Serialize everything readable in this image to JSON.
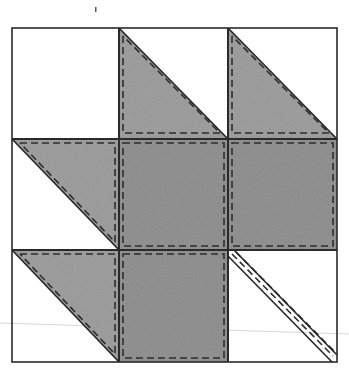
{
  "diagram": {
    "type": "quilt-block",
    "grid": {
      "rows": 3,
      "cols": 3,
      "x_lines": [
        12,
        119,
        228,
        337
      ],
      "y_lines": [
        28,
        139,
        250,
        362
      ]
    },
    "colors": {
      "background": "#ffffff",
      "fabric": "#9c9c9c",
      "fabric_dark": "#8e8e8e",
      "outline": "#2a2a2a",
      "seam": "#333333",
      "scan_line": "#d8d8d8"
    },
    "cells": [
      {
        "row": 0,
        "col": 0,
        "kind": "empty"
      },
      {
        "row": 0,
        "col": 1,
        "kind": "half-square-triangle",
        "filled_half": "lower-left"
      },
      {
        "row": 0,
        "col": 2,
        "kind": "half-square-triangle",
        "filled_half": "lower-left"
      },
      {
        "row": 1,
        "col": 0,
        "kind": "half-square-triangle",
        "filled_half": "upper-right"
      },
      {
        "row": 1,
        "col": 1,
        "kind": "square"
      },
      {
        "row": 1,
        "col": 2,
        "kind": "square"
      },
      {
        "row": 2,
        "col": 0,
        "kind": "half-square-triangle",
        "filled_half": "upper-right"
      },
      {
        "row": 2,
        "col": 1,
        "kind": "square"
      },
      {
        "row": 2,
        "col": 2,
        "kind": "stem",
        "direction": "diagonal-down-right"
      }
    ],
    "artifacts": {
      "top_mark": {
        "x": 95,
        "y": 10
      }
    }
  }
}
